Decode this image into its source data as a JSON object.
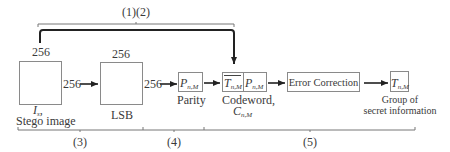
{
  "top_brace": {
    "label": "(1)(2)"
  },
  "stego": {
    "size_top": "256",
    "size_right": "256",
    "symbol_main": "I",
    "symbol_sub": "s",
    "symbol_suffix": ",",
    "caption": "Stego image"
  },
  "lsb": {
    "size_top": "256",
    "size_right": "256",
    "caption": "LSB"
  },
  "parity": {
    "symbol_main": "P",
    "symbol_sub": "n,M",
    "caption": "Parity"
  },
  "codeword": {
    "left_main": "T",
    "left_sub": "n,M",
    "right_main": "P",
    "right_sub": "n,M",
    "caption_line1": "Codeword,",
    "caption_main": "C",
    "caption_sub": "n,M"
  },
  "error_correction": {
    "label": "Error Correction"
  },
  "secret": {
    "symbol_main": "T",
    "symbol_sub": "n,M",
    "caption_line1": "Group of",
    "caption_line2": "secret information"
  },
  "bottom_braces": [
    {
      "label": "(3)"
    },
    {
      "label": "(4)"
    },
    {
      "label": "(5)"
    }
  ]
}
